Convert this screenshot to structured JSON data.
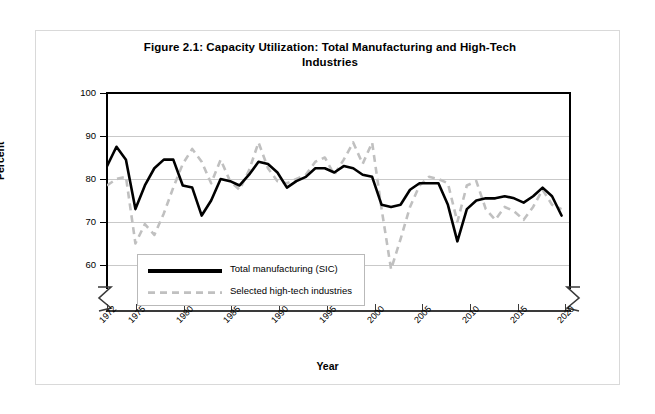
{
  "figure": {
    "title": "Figure 2.1: Capacity Utilization: Total Manufacturing and High-Tech Industries",
    "title_line1": "Figure 2.1: Capacity Utilization: Total Manufacturing and High-Tech",
    "title_line2": "Industries"
  },
  "axes": {
    "y_label": "Percent",
    "x_label": "Year",
    "y_ticks": [
      "100",
      "90",
      "80",
      "70",
      "60"
    ],
    "x_ticks": [
      "1972",
      "1975",
      "1980",
      "1985",
      "1990",
      "1995",
      "2000",
      "2005",
      "2010",
      "2015",
      "2020"
    ]
  },
  "legend": {
    "items": [
      {
        "label": "Total manufacturing (SIC)",
        "color": "#000000",
        "style": "solid"
      },
      {
        "label": "Selected high-tech industries",
        "color": "#c0c0c0",
        "style": "dashed"
      }
    ]
  },
  "chart_data": {
    "type": "line",
    "title": "Figure 2.1: Capacity Utilization: Total Manufacturing and High-Tech Industries",
    "xlabel": "Year",
    "ylabel": "Percent",
    "xlim": [
      1972,
      2021
    ],
    "ylim": [
      58,
      100
    ],
    "ytick_values": [
      60,
      70,
      80,
      90,
      100
    ],
    "xtick_values": [
      1972,
      1975,
      1980,
      1985,
      1990,
      1995,
      2000,
      2005,
      2010,
      2015,
      2020
    ],
    "grid": "horizontal",
    "legend_position": "lower-left-inside",
    "axis_break": "y-axis broken below 60",
    "x": [
      1972,
      1973,
      1974,
      1975,
      1976,
      1977,
      1978,
      1979,
      1980,
      1981,
      1982,
      1983,
      1984,
      1985,
      1986,
      1987,
      1988,
      1989,
      1990,
      1991,
      1992,
      1993,
      1994,
      1995,
      1996,
      1997,
      1998,
      1999,
      2000,
      2001,
      2002,
      2003,
      2004,
      2005,
      2006,
      2007,
      2008,
      2009,
      2010,
      2011,
      2012,
      2013,
      2014,
      2015,
      2016,
      2017,
      2018,
      2019,
      2020
    ],
    "series": [
      {
        "name": "Total manufacturing (SIC)",
        "color": "#000000",
        "style": "solid",
        "values": [
          83.0,
          87.5,
          84.5,
          73.0,
          78.5,
          82.5,
          84.5,
          84.5,
          78.5,
          78.0,
          71.5,
          75.0,
          80.0,
          79.5,
          78.5,
          81.0,
          84.0,
          83.5,
          81.5,
          78.0,
          79.5,
          80.5,
          82.5,
          82.5,
          81.5,
          83.0,
          82.5,
          81.0,
          80.5,
          74.0,
          73.5,
          74.0,
          77.5,
          79.0,
          79.0,
          79.0,
          74.0,
          65.5,
          73.0,
          75.0,
          75.5,
          75.5,
          76.0,
          75.5,
          74.5,
          76.0,
          78.0,
          76.0,
          71.5
        ]
      },
      {
        "name": "Selected high-tech industries",
        "color": "#c0c0c0",
        "style": "dashed",
        "values": [
          78.5,
          80.0,
          80.5,
          65.0,
          69.5,
          67.0,
          72.0,
          78.0,
          83.5,
          87.0,
          84.0,
          79.0,
          84.5,
          79.5,
          77.5,
          82.0,
          88.5,
          82.5,
          79.5,
          79.0,
          80.0,
          81.0,
          84.0,
          85.0,
          81.0,
          84.5,
          88.5,
          83.5,
          88.5,
          73.0,
          59.0,
          66.0,
          73.5,
          78.5,
          80.5,
          80.0,
          79.0,
          70.0,
          78.5,
          79.5,
          73.0,
          70.5,
          73.5,
          72.5,
          70.5,
          73.5,
          77.5,
          74.0,
          73.0
        ]
      }
    ]
  }
}
